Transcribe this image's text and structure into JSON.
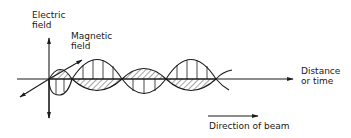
{
  "diagram": {
    "labels": {
      "electric_field": [
        "Electric",
        "field"
      ],
      "magnetic_field": [
        "Magnetic",
        "field"
      ],
      "distance": [
        "Distance",
        "or time"
      ],
      "direction": "Direction of beam"
    },
    "colors": {
      "ink": "#1a1a1a",
      "background": "#ffffff"
    }
  }
}
